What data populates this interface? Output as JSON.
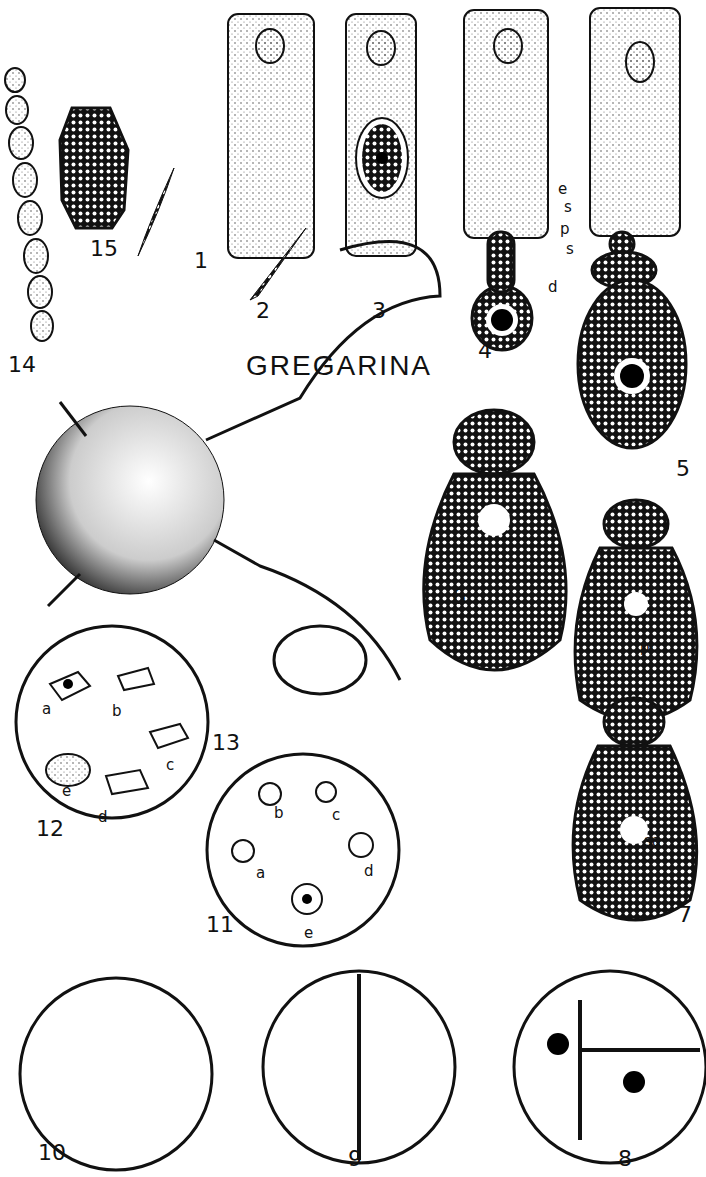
{
  "title": "GREGARINA",
  "figures": [
    {
      "n": "1",
      "x": 194,
      "y": 248
    },
    {
      "n": "2",
      "x": 256,
      "y": 298
    },
    {
      "n": "3",
      "x": 372,
      "y": 298
    },
    {
      "n": "4",
      "x": 478,
      "y": 338
    },
    {
      "n": "5",
      "x": 676,
      "y": 456
    },
    {
      "n": "6",
      "x": 452,
      "y": 584
    },
    {
      "n": "7",
      "x": 678,
      "y": 902
    },
    {
      "n": "8",
      "x": 618,
      "y": 1146
    },
    {
      "n": "9",
      "x": 348,
      "y": 1146
    },
    {
      "n": "10",
      "x": 38,
      "y": 1140
    },
    {
      "n": "11",
      "x": 206,
      "y": 912
    },
    {
      "n": "12",
      "x": 36,
      "y": 816
    },
    {
      "n": "13",
      "x": 212,
      "y": 730
    },
    {
      "n": "14",
      "x": 8,
      "y": 352
    },
    {
      "n": "15",
      "x": 90,
      "y": 236
    }
  ],
  "part_labels": [
    {
      "t": "e",
      "x": 558,
      "y": 180
    },
    {
      "t": "s",
      "x": 564,
      "y": 198
    },
    {
      "t": "p",
      "x": 560,
      "y": 220
    },
    {
      "t": "s",
      "x": 566,
      "y": 240
    },
    {
      "t": "d",
      "x": 548,
      "y": 278
    },
    {
      "t": "pr",
      "x": 640,
      "y": 638
    },
    {
      "t": "sa",
      "x": 644,
      "y": 832
    }
  ],
  "fig12_labels": [
    {
      "t": "a",
      "x": 42,
      "y": 700
    },
    {
      "t": "b",
      "x": 112,
      "y": 702
    },
    {
      "t": "c",
      "x": 166,
      "y": 756
    },
    {
      "t": "e",
      "x": 62,
      "y": 782
    },
    {
      "t": "d",
      "x": 98,
      "y": 808
    }
  ],
  "fig11_labels": [
    {
      "t": "b",
      "x": 274,
      "y": 804
    },
    {
      "t": "c",
      "x": 332,
      "y": 806
    },
    {
      "t": "a",
      "x": 256,
      "y": 864
    },
    {
      "t": "d",
      "x": 364,
      "y": 862
    },
    {
      "t": "e",
      "x": 304,
      "y": 924
    }
  ]
}
